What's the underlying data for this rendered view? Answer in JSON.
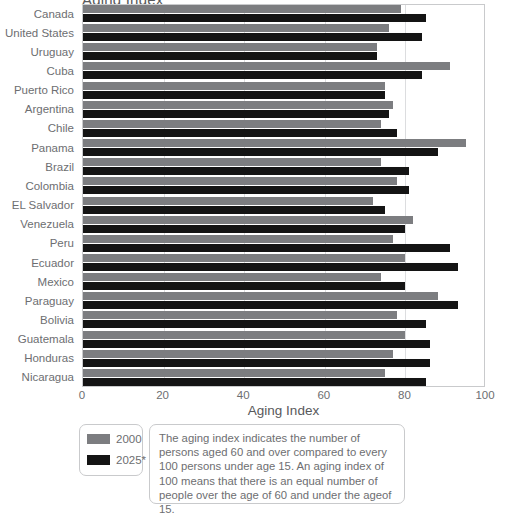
{
  "chart_data": {
    "type": "bar",
    "orientation": "horizontal",
    "title": "Aging Index",
    "title_clipped": true,
    "xlabel": "Aging Index",
    "ylabel": "",
    "xlim": [
      0,
      100
    ],
    "xticks": [
      0,
      20,
      40,
      60,
      80,
      100
    ],
    "grid": true,
    "grid_axis": "x",
    "legend_position": "bottom-left",
    "categories": [
      "Canada",
      "United States",
      "Uruguay",
      "Cuba",
      "Puerto Rico",
      "Argentina",
      "Chile",
      "Panama",
      "Brazil",
      "Colombia",
      "EL Salvador",
      "Venezuela",
      "Peru",
      "Ecuador",
      "Mexico",
      "Paraguay",
      "Bolivia",
      "Guatemala",
      "Honduras",
      "Nicaragua"
    ],
    "series": [
      {
        "name": "2000",
        "color": "#7c7d80",
        "values": [
          79,
          76,
          73,
          91,
          75,
          77,
          74,
          95,
          74,
          78,
          72,
          82,
          77,
          80,
          74,
          88,
          78,
          80,
          77,
          75
        ]
      },
      {
        "name": "2025*",
        "color": "#141414",
        "values": [
          85,
          84,
          73,
          84,
          75,
          76,
          78,
          88,
          81,
          81,
          75,
          80,
          91,
          93,
          80,
          93,
          85,
          86,
          86,
          85
        ]
      }
    ]
  },
  "axis": {
    "x_label": "Aging Index",
    "tick_labels": [
      "0",
      "20",
      "40",
      "60",
      "80",
      "100"
    ]
  },
  "legend": {
    "items": [
      {
        "label": "2000",
        "color": "#7c7d80"
      },
      {
        "label": "2025*",
        "color": "#141414"
      }
    ]
  },
  "note": {
    "text": "The aging index indicates the number of persons aged 60 and over compared to every 100 persons under age 15. An aging index of 100 means that there is an equal number of people over the age of 60 and under the ageof 15."
  },
  "colors": {
    "series_2000": "#7c7d80",
    "series_2025": "#141414",
    "grid": "#dcdddf",
    "frame": "#c9cacc",
    "text": "#6d6e71",
    "background": "#ffffff"
  }
}
